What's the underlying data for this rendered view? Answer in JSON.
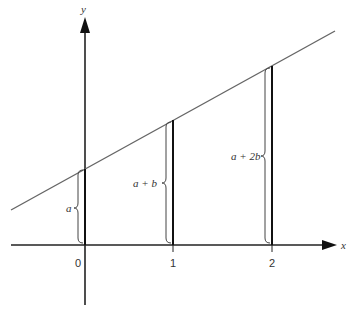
{
  "diagram": {
    "axes": {
      "x_label": "x",
      "y_label": "y",
      "ticks": [
        "0",
        "1",
        "2"
      ]
    },
    "line": {
      "description": "y = a + b x",
      "stroke": "#555555"
    },
    "segments": [
      {
        "x_tick": "0",
        "label": "a"
      },
      {
        "x_tick": "1",
        "label": "a + b"
      },
      {
        "x_tick": "2",
        "label": "a + 2b"
      }
    ],
    "colors": {
      "axis": "#111111",
      "line": "#666666",
      "text": "#333333"
    }
  }
}
